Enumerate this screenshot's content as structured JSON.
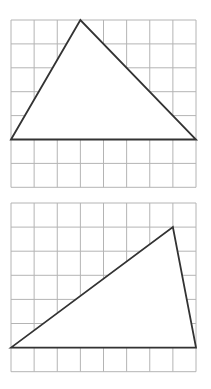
{
  "figures": [
    {
      "id": "top",
      "grid": {
        "cols": 8,
        "rows": 7,
        "x0": 11,
        "y0": 20,
        "cell_w": 23.125,
        "cell_h": 23.9
      },
      "triangle": {
        "vertices": [
          [
            0,
            5
          ],
          [
            3,
            0
          ],
          [
            8,
            5
          ]
        ]
      }
    },
    {
      "id": "bottom",
      "grid": {
        "cols": 8,
        "rows": 7,
        "x0": 11,
        "y0": 203,
        "cell_w": 23.125,
        "cell_h": 24.1
      },
      "triangle": {
        "vertices": [
          [
            0,
            6
          ],
          [
            7,
            1
          ],
          [
            8,
            6
          ]
        ]
      }
    }
  ],
  "colors": {
    "grid": "#b4b4b4",
    "triangle_stroke": "#333333",
    "background": "#ffffff"
  }
}
